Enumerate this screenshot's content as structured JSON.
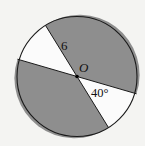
{
  "diagram": {
    "center_label": "O",
    "radius_label": "6",
    "angle_label": "40°",
    "colors": {
      "background": "#f4f4f2",
      "shaded": "#8e8e8e",
      "unshaded": "#fbfbfb",
      "stroke": "#1a1a1a"
    }
  }
}
